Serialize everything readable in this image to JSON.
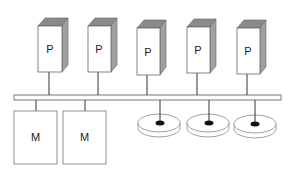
{
  "diagram": {
    "title": "",
    "processors": [
      {
        "label": "P",
        "x": 38
      },
      {
        "label": "P",
        "x": 88
      },
      {
        "label": "P",
        "x": 137
      },
      {
        "label": "P",
        "x": 187
      },
      {
        "label": "P",
        "x": 237
      }
    ],
    "memories": [
      {
        "label": "M",
        "x": 14
      },
      {
        "label": "M",
        "x": 63
      }
    ],
    "disks": [
      {
        "label": "disk",
        "cx": 159
      },
      {
        "label": "disk",
        "cx": 208
      },
      {
        "label": "disk",
        "cx": 255
      }
    ],
    "bus": {
      "label": "shared bus"
    },
    "colors": {
      "stroke": "#555555",
      "box_front": "#ffffff",
      "box_top": "#8a8a8a",
      "box_side": "#a0a0a0",
      "bus_fill": "#ffffff"
    }
  }
}
